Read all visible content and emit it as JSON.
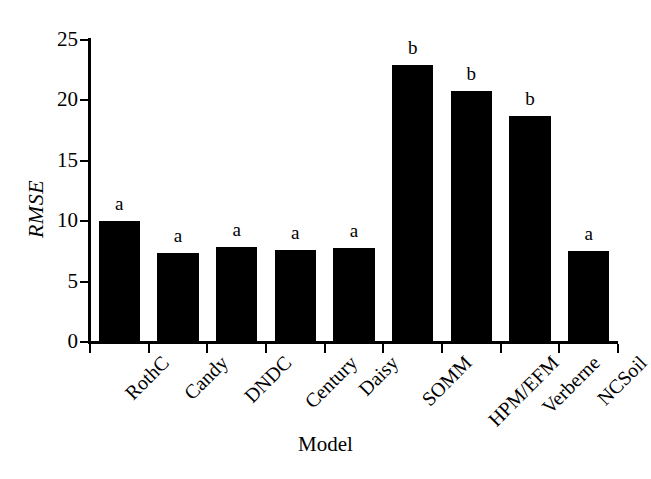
{
  "chart_data": {
    "type": "bar",
    "title": "",
    "subtitle": "",
    "xlabel": "Model",
    "ylabel": "RMSE",
    "categories": [
      "RothC",
      "Candy",
      "DNDC",
      "Century",
      "Daisy",
      "SOMM",
      "HPM/EFM",
      "Verberne",
      "NCSoil"
    ],
    "values": [
      10.0,
      7.4,
      7.9,
      7.6,
      7.8,
      22.9,
      20.8,
      18.7,
      7.5
    ],
    "annotations": [
      "a",
      "a",
      "a",
      "a",
      "a",
      "b",
      "b",
      "b",
      "a"
    ],
    "ylim": [
      0,
      25
    ],
    "yticks": [
      0,
      5,
      10,
      15,
      20,
      25
    ],
    "ytick_labels": [
      "0",
      "5",
      "10",
      "15",
      "20",
      "25"
    ],
    "grid": false,
    "legend": false,
    "legend_position": "none",
    "bar_color": "#000000",
    "background_color": "#ffffff",
    "axis_color": "#000000",
    "xlabel_rotation": -45,
    "ylabel_style": "italic"
  },
  "axis": {
    "y_title": "RMSE",
    "x_title": "Model"
  }
}
